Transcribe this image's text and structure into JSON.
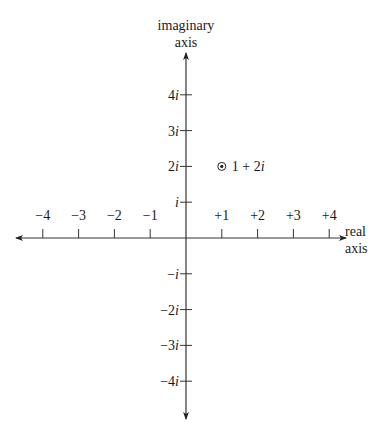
{
  "diagram": {
    "origin": {
      "x": 186,
      "y": 238
    },
    "unit_px": 35.8,
    "imaginary_axis": {
      "label_line1": "imaginary",
      "label_line2": "axis",
      "ticks": [
        {
          "value": 4,
          "label_num": "4",
          "label_i": "i"
        },
        {
          "value": 3,
          "label_num": "3",
          "label_i": "i"
        },
        {
          "value": 2,
          "label_num": "2",
          "label_i": "i"
        },
        {
          "value": 1,
          "label_num": "",
          "label_i": "i"
        },
        {
          "value": -1,
          "label_num": "−",
          "label_i": "i"
        },
        {
          "value": -2,
          "label_num": "−2",
          "label_i": "i"
        },
        {
          "value": -3,
          "label_num": "−3",
          "label_i": "i"
        },
        {
          "value": -4,
          "label_num": "−4",
          "label_i": "i"
        }
      ]
    },
    "real_axis": {
      "label_line1": "real",
      "label_line2": "axis",
      "ticks": [
        {
          "value": -4,
          "label": "−4"
        },
        {
          "value": -3,
          "label": "−3"
        },
        {
          "value": -2,
          "label": "−2"
        },
        {
          "value": -1,
          "label": "−1"
        },
        {
          "value": 1,
          "label": "+1"
        },
        {
          "value": 2,
          "label": "+2"
        },
        {
          "value": 3,
          "label": "+3"
        },
        {
          "value": 4,
          "label": "+4"
        }
      ]
    },
    "point": {
      "re": 1,
      "im": 2,
      "label_prefix": "1 + 2",
      "label_i": "i"
    },
    "colors": {
      "axis": "#333333",
      "text": "#1a1a1a"
    }
  }
}
